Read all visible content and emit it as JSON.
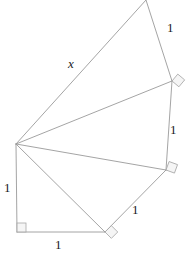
{
  "figure": {
    "canvas": {
      "width": 186,
      "height": 266
    },
    "stroke_color": "#9a9a9a",
    "marker_fill": "#f2f2f2",
    "marker_stroke": "#a8a8a8",
    "text_color": "#1a1a1a",
    "apex": {
      "x": 16,
      "y": 144
    },
    "vertices": [
      {
        "name": "apex",
        "x": 16,
        "y": 144
      },
      {
        "name": "bottom-left-corner",
        "x": 17,
        "y": 232
      },
      {
        "name": "bottom-right-corner",
        "x": 105,
        "y": 232
      },
      {
        "name": "lower-right-vertex",
        "x": 166,
        "y": 170
      },
      {
        "name": "upper-right-vertex",
        "x": 172,
        "y": 81
      },
      {
        "name": "top-vertex",
        "x": 146,
        "y": 0
      }
    ],
    "labels": [
      {
        "id": "left-side",
        "text": "1",
        "x": 4,
        "y": 181,
        "style": "roman"
      },
      {
        "id": "bottom-side",
        "text": "1",
        "x": 55,
        "y": 238,
        "style": "roman"
      },
      {
        "id": "lower-right-side",
        "text": "1",
        "x": 132,
        "y": 203,
        "style": "roman"
      },
      {
        "id": "right-side",
        "text": "1",
        "x": 170,
        "y": 123,
        "style": "roman"
      },
      {
        "id": "upper-right-side",
        "text": "1",
        "x": 167,
        "y": 21,
        "style": "roman"
      },
      {
        "id": "hypotenuse-unknown",
        "text": "x",
        "x": 68,
        "y": 57,
        "style": "italic"
      }
    ],
    "segments": [
      {
        "id": "apex-to-bottom-left",
        "from": "apex",
        "to": "bottom-left-corner"
      },
      {
        "id": "bottom-edge",
        "from": "bottom-left-corner",
        "to": "bottom-right-corner"
      },
      {
        "id": "apex-to-bottom-right",
        "from": "apex",
        "to": "bottom-right-corner"
      },
      {
        "id": "bottom-right-to-lower-right",
        "from": "bottom-right-corner",
        "to": "lower-right-vertex"
      },
      {
        "id": "apex-to-lower-right",
        "from": "apex",
        "to": "lower-right-vertex"
      },
      {
        "id": "lower-right-to-upper-right",
        "from": "lower-right-vertex",
        "to": "upper-right-vertex"
      },
      {
        "id": "apex-to-upper-right",
        "from": "apex",
        "to": "upper-right-vertex"
      },
      {
        "id": "upper-right-to-top",
        "from": "upper-right-vertex",
        "to": "top-vertex"
      },
      {
        "id": "apex-to-top",
        "from": "apex",
        "to": "top-vertex"
      }
    ],
    "right_angle_markers": [
      {
        "id": "marker-bottom-left",
        "x": 17,
        "y": 232,
        "rotation": 0
      },
      {
        "id": "marker-bottom-right",
        "x": 105,
        "y": 232,
        "rotation": 45
      },
      {
        "id": "marker-lower-right",
        "x": 166,
        "y": 170,
        "rotation": 20
      },
      {
        "id": "marker-upper-right",
        "x": 172,
        "y": 81,
        "rotation": 40
      }
    ]
  }
}
